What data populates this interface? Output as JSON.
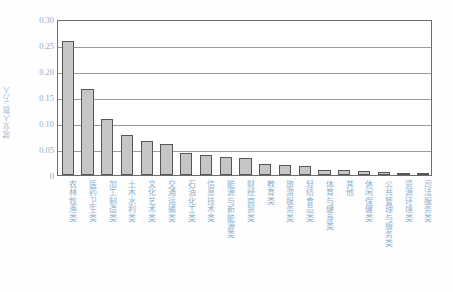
{
  "chart_data": {
    "type": "bar",
    "title": "",
    "xlabel": "",
    "ylabel": "就业人数/万人",
    "ylim": [
      0,
      0.3
    ],
    "yticks": [
      "0",
      "0.05",
      "0.10",
      "0.15",
      "0.20",
      "0.25",
      "0.30"
    ],
    "ytick_values": [
      0,
      0.05,
      0.1,
      0.15,
      0.2,
      0.25,
      0.3
    ],
    "grid": true,
    "legend": null,
    "categories": [
      "农林牧渔类",
      "医药卫生类",
      "加工制造类",
      "土木水利类",
      "文化艺术类",
      "交通运输类",
      "石油化工类",
      "信息技术类",
      "能源与新能源类",
      "财经商贸类",
      "教育类",
      "旅游服务类",
      "轻纺食品类",
      "体育与健身类",
      "其他",
      "休闲保健类",
      "公共管理与服务类",
      "资源环境类",
      "司法服务类"
    ],
    "values": [
      0.257,
      0.165,
      0.108,
      0.077,
      0.065,
      0.06,
      0.042,
      0.038,
      0.035,
      0.033,
      0.021,
      0.019,
      0.018,
      0.01,
      0.009,
      0.008,
      0.005,
      0.004,
      0.003
    ]
  }
}
